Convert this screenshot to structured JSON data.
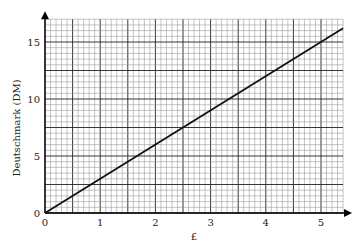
{
  "chart_data": {
    "type": "line",
    "title": "",
    "xlabel": "£",
    "ylabel": "Deutschmark (DM)",
    "xlim": [
      0,
      5.4
    ],
    "ylim": [
      0,
      17
    ],
    "x_ticks": [
      0,
      1,
      2,
      3,
      4,
      5
    ],
    "y_ticks": [
      0,
      5,
      10,
      15
    ],
    "grid": true,
    "series": [
      {
        "name": "Conversion",
        "x": [
          0,
          5.4
        ],
        "y": [
          0,
          16.2
        ]
      }
    ],
    "rate_dm_per_pound": 3
  },
  "colors": {
    "grid_major": "#222222",
    "grid_minor": "#8a8a8a",
    "line": "#111111"
  }
}
